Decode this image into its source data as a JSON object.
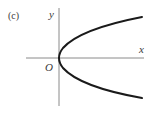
{
  "figure": {
    "panel_label": "(c)",
    "x_axis_label": "x",
    "y_axis_label": "y",
    "origin_label": "O",
    "curve_description": "parabola opening to the right, x = y^2, vertex at origin",
    "colors": {
      "axis": "#8a8a8a",
      "curve": "#1a1a1a",
      "text": "#3a3a3a",
      "background": "#ffffff"
    }
  }
}
